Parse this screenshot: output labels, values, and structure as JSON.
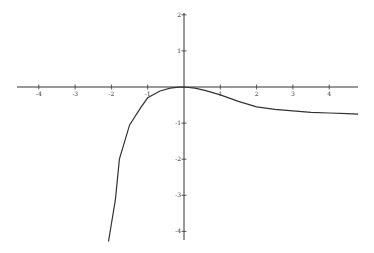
{
  "chart_data": {
    "type": "line",
    "title": "",
    "xlabel": "",
    "ylabel": "",
    "xlim": [
      -4.6,
      4.8
    ],
    "ylim": [
      -4.3,
      2.0
    ],
    "grid": false,
    "legend": null,
    "x_ticks": [
      -4,
      -3,
      -2,
      -1,
      1,
      2,
      3,
      4
    ],
    "x_tick_labels": [
      "-4",
      "-3",
      "-2",
      "-1",
      "1",
      "2",
      "3",
      "4"
    ],
    "y_ticks": [
      2,
      1,
      -1,
      -2,
      -3,
      -4
    ],
    "y_tick_labels": [
      "2",
      "1",
      "-1",
      "-2",
      "-3",
      "-4"
    ],
    "series": [
      {
        "name": "f(x)",
        "color": "#333333",
        "x": [
          -2.08,
          -1.89,
          -1.78,
          -1.5,
          -1.18,
          -1.0,
          -0.66,
          -0.38,
          -0.15,
          0.0,
          0.3,
          0.6,
          1.0,
          1.5,
          2.0,
          2.5,
          3.0,
          3.5,
          4.0,
          4.5,
          4.8
        ],
        "y": [
          -4.28,
          -3.12,
          -2.0,
          -1.05,
          -0.55,
          -0.3,
          -0.11,
          -0.03,
          -0.005,
          0.0,
          -0.03,
          -0.1,
          -0.22,
          -0.4,
          -0.55,
          -0.62,
          -0.66,
          -0.7,
          -0.72,
          -0.74,
          -0.75
        ]
      }
    ]
  },
  "axes": {
    "color": "#333333",
    "origin_px": [
      184,
      87
    ],
    "x_unit_px": 36.3,
    "y_unit_px": 36.1,
    "x_axis_px": [
      17,
      358
    ],
    "y_axis_px": [
      13,
      240
    ]
  }
}
